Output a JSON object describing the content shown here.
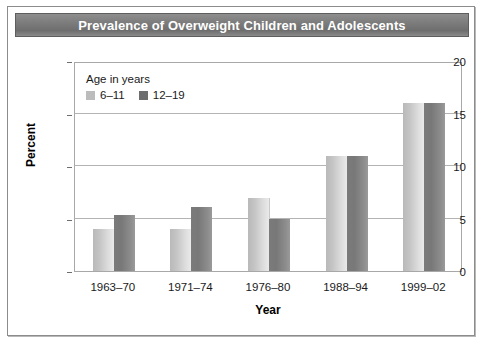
{
  "figure": {
    "title": "Prevalence of Overweight Children and Adolescents",
    "border_color": "#8c8c8c",
    "title_bar_color": "#7c7c7c",
    "title_text_color": "#ffffff"
  },
  "legend": {
    "title": "Age in years",
    "position": "inside-top-left",
    "entries": [
      {
        "label": "6–11",
        "color": "#bcbcbc",
        "swatch": "legend-swatch-light"
      },
      {
        "label": "12–19",
        "color": "#6e6e6e",
        "swatch": "legend-swatch-dark"
      }
    ]
  },
  "chart_data": {
    "type": "bar",
    "title": "Prevalence of Overweight Children and Adolescents",
    "xlabel": "Year",
    "ylabel": "Percent",
    "categories": [
      "1963–70",
      "1971–74",
      "1976–80",
      "1988–94",
      "1999–02"
    ],
    "series": [
      {
        "name": "6–11",
        "color": "#c8c8c8",
        "values": [
          4.0,
          4.0,
          7.0,
          11.0,
          16.0
        ]
      },
      {
        "name": "12–19",
        "color": "#7e7e7e",
        "values": [
          5.3,
          6.1,
          5.0,
          11.0,
          16.0
        ]
      }
    ],
    "ylim": [
      0,
      20
    ],
    "yticks": [
      0,
      5,
      10,
      15,
      20
    ],
    "ytick_labels": [
      "0",
      "5",
      "10",
      "15",
      "20"
    ],
    "grid": true,
    "grid_axis": "y",
    "legend_position": "inside-top-left"
  }
}
